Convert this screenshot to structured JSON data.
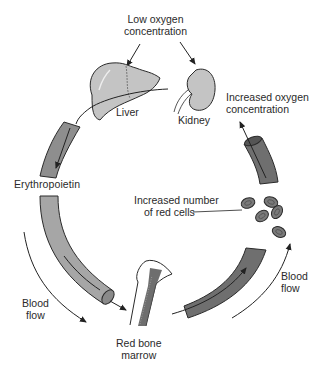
{
  "labels": {
    "low_oxygen_line1": "Low oxygen",
    "low_oxygen_line2": "concentration",
    "liver": "Liver",
    "kidney": "Kidney",
    "increased_oxygen_line1": "Increased oxygen",
    "increased_oxygen_line2": "concentration",
    "erythropoietin": "Erythropoietin",
    "red_cells_line1": "Increased number",
    "red_cells_line2": "of red cells",
    "blood_flow_left_line1": "Blood",
    "blood_flow_left_line2": "flow",
    "blood_flow_right_line1": "Blood",
    "blood_flow_right_line2": "flow",
    "marrow_line1": "Red bone",
    "marrow_line2": "marrow"
  },
  "colors": {
    "organ_fill": "#c4c4c4",
    "vessel_light": "#a6a6a6",
    "vessel_dark": "#6f6f6f",
    "cell_fill": "#7a7a7a",
    "outline": "#2a2a2a",
    "background": "#ffffff"
  },
  "red_cell_count": 5
}
